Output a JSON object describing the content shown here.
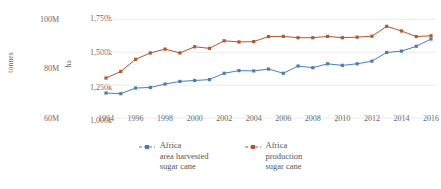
{
  "chart_data": {
    "type": "line",
    "title": "",
    "xlabel": "",
    "x": [
      1994,
      1995,
      1996,
      1997,
      1998,
      1999,
      2000,
      2001,
      2002,
      2003,
      2004,
      2005,
      2006,
      2007,
      2008,
      2009,
      2010,
      2011,
      2012,
      2013,
      2014,
      2015,
      2016
    ],
    "xtick_labels": [
      "1994",
      "1996",
      "1998",
      "2000",
      "2002",
      "2004",
      "2006",
      "2008",
      "2010",
      "2012",
      "2014",
      "2016"
    ],
    "grid": true,
    "legend_position": "bottom",
    "axes": [
      {
        "id": "left",
        "name": "tonnes",
        "title": "tonnes",
        "tick_labels": [
          "100M",
          "80M",
          "60M"
        ],
        "tick_values": [
          100000000,
          80000000,
          60000000
        ],
        "ylim": [
          52000000,
          108000000
        ]
      },
      {
        "id": "right",
        "name": "ha",
        "title": "ha",
        "tick_labels": [
          "1,750k",
          "1,500k",
          "1,250k",
          "1,000k"
        ],
        "tick_values": [
          1750000,
          1500000,
          1250000,
          1000000
        ],
        "ylim": [
          970000,
          1790000
        ]
      }
    ],
    "series": [
      {
        "name": "Africa\narea harvested\nsugar cane",
        "legend_label": "Africa\narea harvested\nsugar cane",
        "axis": "right",
        "unit": "ha",
        "color": "#4a7ebb",
        "values": [
          1190000,
          1185000,
          1228000,
          1232000,
          1258000,
          1278000,
          1285000,
          1292000,
          1340000,
          1360000,
          1358000,
          1372000,
          1340000,
          1395000,
          1382000,
          1412000,
          1400000,
          1412000,
          1432000,
          1498000,
          1508000,
          1545000,
          1600000
        ]
      },
      {
        "name": "Africa\nproduction\nsugar cane",
        "legend_label": "Africa\nproduction\nsugar cane",
        "axis": "left",
        "unit": "tonnes",
        "color": "#b5562c",
        "values": [
          74800000,
          78200000,
          84500000,
          87800000,
          89800000,
          87800000,
          91000000,
          90200000,
          94100000,
          93500000,
          93700000,
          96300000,
          96400000,
          95700000,
          95700000,
          96400000,
          95700000,
          96000000,
          96500000,
          101600000,
          99200000,
          96300000,
          96700000
        ]
      }
    ]
  },
  "legend": {
    "items": [
      {
        "label": "Africa\narea harvested\nsugar cane",
        "color": "#4a7ebb"
      },
      {
        "label": "Africa\nproduction\nsugar cane",
        "color": "#b5562c"
      }
    ]
  }
}
